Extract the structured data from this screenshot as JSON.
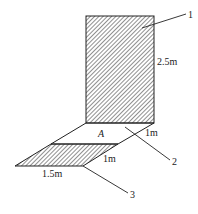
{
  "diagram": {
    "type": "technical-area-sketch",
    "colors": {
      "line": "#222222",
      "background": "#ffffff",
      "hatch": "#333333"
    },
    "parts": [
      {
        "id": "1",
        "label": "1",
        "description": "vertical hatched rectangle"
      },
      {
        "id": "2",
        "label": "2",
        "description": "unhatched parallelogram region A"
      },
      {
        "id": "3",
        "label": "3",
        "description": "lower hatched parallelogram"
      }
    ],
    "region_label": "A",
    "dimensions": {
      "rect_height": "2.5m",
      "upper_depth": "1m",
      "lower_depth": "1m",
      "lower_width": "1.5m"
    }
  }
}
